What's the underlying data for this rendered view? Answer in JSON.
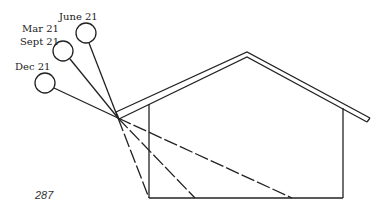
{
  "diagram": {
    "labels": {
      "june": "June 21",
      "mar_sept_1": "Mar 21",
      "mar_sept_2": "Sept 21",
      "dec": "Dec 21"
    },
    "page_number": "287",
    "suns": [
      {
        "name": "June 21",
        "cx": 86,
        "cy": 33,
        "r": 10
      },
      {
        "name": "Mar 21 / Sept 21",
        "cx": 63,
        "cy": 51,
        "r": 10
      },
      {
        "name": "Dec 21",
        "cx": 45,
        "cy": 83,
        "r": 10
      }
    ],
    "line_color": "#222222"
  }
}
